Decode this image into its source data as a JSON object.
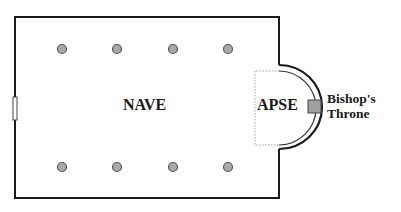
{
  "labels": {
    "nave": "NAVE",
    "apse": "APSE",
    "throne_line1": "Bishop's",
    "throne_line2": "Throne"
  },
  "colors": {
    "wall": "#1a1a1a",
    "column_fill": "#a9a9a9",
    "column_stroke": "#555555",
    "throne_fill": "#a0a0a0"
  },
  "columns": {
    "top_row_y": 49,
    "bottom_row_y": 167,
    "x_positions": [
      62,
      117,
      173,
      228
    ]
  }
}
